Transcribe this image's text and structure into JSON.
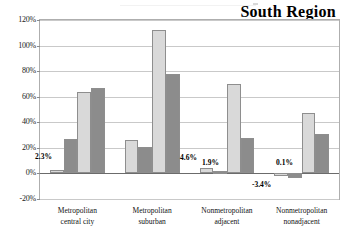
{
  "chart_data": {
    "type": "bar",
    "title": "South Region",
    "xlabel": "",
    "ylabel": "",
    "ylim": [
      -20,
      120
    ],
    "yticks": [
      -20,
      0,
      20,
      40,
      60,
      80,
      100,
      120
    ],
    "ytick_labels": [
      "-20%",
      "0%",
      "20%",
      "40%",
      "60%",
      "80%",
      "100%",
      "120%"
    ],
    "grid": true,
    "legend_position": "none",
    "categories": [
      "Metropolitan central city",
      "Metropolitan suburban",
      "Nonmetropolitan adjacent",
      "Nonmetropolitan nonadjacent"
    ],
    "category_lines": [
      [
        "Metropolitan",
        "central city"
      ],
      [
        "Metropolitan",
        "suburban"
      ],
      [
        "Nonmetropolitan",
        "adjacent"
      ],
      [
        "Nonmetropolitan",
        "nonadjacent"
      ]
    ],
    "series": [
      {
        "name": "Series 1",
        "color": "#d9d9d9",
        "values": [
          2.3,
          26.0,
          4.6,
          0.1
        ]
      },
      {
        "name": "Series 2",
        "color": "#8c8c8c",
        "values": [
          27.0,
          21.0,
          1.9,
          -3.4
        ]
      },
      {
        "name": "Series 3",
        "color": "#d9d9d9",
        "values": [
          64.0,
          112.0,
          70.0,
          47.0
        ]
      },
      {
        "name": "Series 4",
        "color": "#8c8c8c",
        "values": [
          67.0,
          78.0,
          28.0,
          31.0
        ]
      }
    ],
    "data_labels": [
      {
        "text": "2.3%",
        "x": 35,
        "y": 152
      },
      {
        "text": "4.6%",
        "x": 180,
        "y": 153
      },
      {
        "text": "1.9%",
        "x": 202,
        "y": 158
      },
      {
        "text": "0.1%",
        "x": 276,
        "y": 158
      },
      {
        "text": "-3.4%",
        "x": 252,
        "y": 180
      }
    ]
  },
  "axis": {
    "ticks": [
      {
        "label": "120%",
        "value": 120
      },
      {
        "label": "100%",
        "value": 100
      },
      {
        "label": "80%",
        "value": 80
      },
      {
        "label": "60%",
        "value": 60
      },
      {
        "label": "40%",
        "value": 40
      },
      {
        "label": "20%",
        "value": 20
      },
      {
        "label": "0%",
        "value": 0
      },
      {
        "label": "-20%",
        "value": -20
      }
    ]
  },
  "colors": {
    "light_series": "#d9d9d9",
    "dark_series": "#8c8c8c",
    "grid": "#c9c9c9",
    "frame": "#aeaeae",
    "zero_axis": "#6b6b6b",
    "text": "#000000"
  }
}
